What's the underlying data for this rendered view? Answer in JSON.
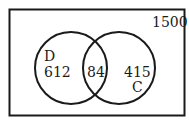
{
  "diagram": {
    "type": "venn",
    "universe_total": "1500",
    "sets": [
      {
        "name": "D",
        "only_value": "612"
      },
      {
        "name": "C",
        "only_value": "415"
      }
    ],
    "intersection_value": "84",
    "colors": {
      "stroke": "#1a1a1a",
      "background": "#ffffff"
    }
  }
}
